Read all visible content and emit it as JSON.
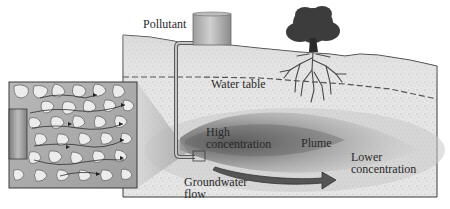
{
  "diagram": {
    "type": "groundwater-contamination-illustration",
    "labels": {
      "pollutant": "Pollutant",
      "water_table": "Water table",
      "high_concentration_line1": "High",
      "high_concentration_line2": "concentration",
      "plume": "Plume",
      "lower_concentration_line1": "Lower",
      "lower_concentration_line2": "concentration",
      "groundwater_flow_line1": "Groundwater",
      "groundwater_flow_line2": "flow"
    },
    "elements": [
      {
        "id": "pollutant-tank",
        "icon": "tank-icon"
      },
      {
        "id": "pipe",
        "icon": "pipe-icon"
      },
      {
        "id": "tree",
        "icon": "tree-icon"
      },
      {
        "id": "soil-block",
        "icon": "soil-cross-section"
      },
      {
        "id": "water-table-line",
        "icon": "dashed-line"
      },
      {
        "id": "plume",
        "icon": "plume-shape"
      },
      {
        "id": "flow-arrow",
        "icon": "arrow-right-icon"
      },
      {
        "id": "magnified-inset",
        "icon": "pore-space-inset"
      }
    ],
    "colors": {
      "soil": "#e4e4e4",
      "soil_speckle": "#9a9a9a",
      "outline": "#3a3a3a",
      "plume_dark": "#6e6e6e",
      "plume_light": "#c8c8c8",
      "arrow": "#4a4a4a",
      "tank": "#b4b4b4",
      "tree": "#3c3c3c",
      "text": "#2a2a2a"
    }
  }
}
